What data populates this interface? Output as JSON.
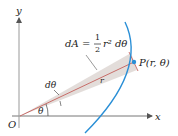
{
  "diagram": {
    "axis_x_label": "x",
    "axis_y_label": "y",
    "origin_label": "O",
    "theta_label": "θ",
    "dtheta_label": "dθ",
    "r_label": "r",
    "area_formula": {
      "lhs": "dA",
      "eq": "=",
      "frac_num": "1",
      "frac_den": "2",
      "rhs": "r² dθ"
    },
    "point_label": "P(r, θ)",
    "colors": {
      "curve": "#2a8fd6",
      "sector_fill": "#e0d9d6",
      "radius_line": "#c0504d",
      "point": "#2a8fd6",
      "axis": "#555555"
    }
  }
}
